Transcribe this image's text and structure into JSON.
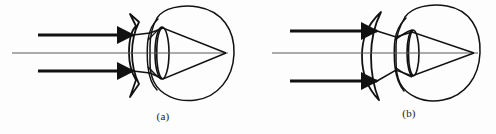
{
  "figure": {
    "width": 496,
    "height": 134,
    "background_color": "#fdfdfd",
    "ink_color": "#111111",
    "axis_color": "#555555"
  },
  "panels": [
    {
      "id": "a",
      "caption": "(a)",
      "condition": "myopia-nearsighted-corrected",
      "corrective_lens": {
        "name": "biconcave-diverging-lens",
        "type": "diverging",
        "shape": "biconcave",
        "x": 133,
        "top_y": 14,
        "bottom_y": 97
      },
      "eye": {
        "name": "eyeball",
        "center_x": 190,
        "center_y": 53,
        "radius": 44
      },
      "crystalline_lens": {
        "name": "crystalline-lens",
        "x": 162,
        "rx": 7,
        "ry": 26
      },
      "optical_axis": {
        "name": "optical-axis",
        "x_start": 12,
        "x_end": 228,
        "y": 53
      },
      "rays": [
        {
          "name": "incident-ray-upper",
          "y": 35,
          "x_start": 38,
          "x_end": 133
        },
        {
          "name": "incident-ray-lower",
          "y": 71,
          "x_start": 38,
          "x_end": 133
        }
      ],
      "focus_point": {
        "name": "retinal-focus-point",
        "x": 226,
        "y": 53
      }
    },
    {
      "id": "b",
      "caption": "(b)",
      "condition": "hyperopia-farsighted-corrected",
      "corrective_lens": {
        "name": "convex-converging-lens",
        "type": "converging",
        "shape": "meniscus-convex",
        "x": 377,
        "top_y": 12,
        "bottom_y": 100
      },
      "eye": {
        "name": "eyeball",
        "center_x": 433,
        "center_y": 53,
        "radius": 44
      },
      "crystalline_lens": {
        "name": "crystalline-lens",
        "x": 413,
        "rx": 6,
        "ry": 23
      },
      "optical_axis": {
        "name": "optical-axis",
        "x_start": 272,
        "x_end": 478,
        "y": 53
      },
      "rays": [
        {
          "name": "incident-ray-upper",
          "y": 31,
          "x_start": 290,
          "x_end": 377
        },
        {
          "name": "incident-ray-lower",
          "y": 81,
          "x_start": 290,
          "x_end": 377
        }
      ],
      "focus_point": {
        "name": "retinal-focus-point",
        "x": 474,
        "y": 53
      }
    }
  ]
}
